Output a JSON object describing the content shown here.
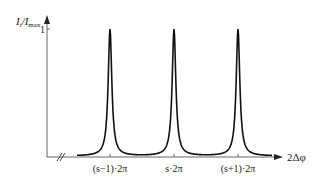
{
  "chart_data": {
    "type": "line",
    "title": "",
    "xlabel": "2Δφ",
    "ylabel": "I_t/I_max",
    "ylabel_main": "I",
    "ylabel_sub1": "t",
    "ylabel_mid": "/I",
    "ylabel_sub2": "max",
    "y_ticks": [
      {
        "value": 1,
        "label": "1"
      }
    ],
    "x_ticks": [
      {
        "label": "(s−1)·2π",
        "position": "(s-1)*2pi"
      },
      {
        "label": "s·2π",
        "position": "s*2pi"
      },
      {
        "label": "(s+1)·2π",
        "position": "(s+1)*2pi"
      }
    ],
    "series": [
      {
        "name": "transmission",
        "description": "Airy-like sharp transmission peaks of height 1 at each multiple of 2π",
        "peaks": [
          {
            "x": "(s-1)*2pi",
            "y": 1
          },
          {
            "x": "s*2pi",
            "y": 1
          },
          {
            "x": "(s+1)*2pi",
            "y": 1
          }
        ],
        "baseline": 0
      }
    ],
    "ylim": [
      0,
      1
    ],
    "grid": false,
    "legend": "none",
    "axis_break_on_x": true
  },
  "colors": {
    "axis": "#555555",
    "curve": "#111111"
  }
}
